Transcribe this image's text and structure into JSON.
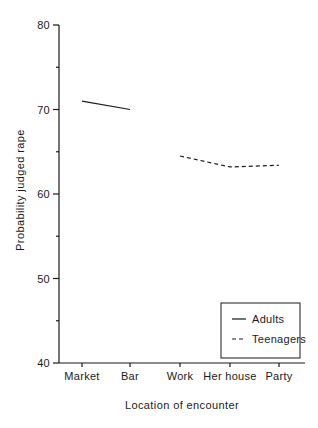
{
  "figure": {
    "background": "#ffffff",
    "ink_color": "#1a1a1a"
  },
  "chart_data": {
    "type": "line",
    "title": "",
    "xlabel": "Location of encounter",
    "ylabel": "Probability judged rape",
    "categories": [
      "Market",
      "Bar",
      "Work",
      "Her house",
      "Party"
    ],
    "series": [
      {
        "name": "Adults",
        "style": "solid",
        "values": [
          71,
          70,
          null,
          null,
          null
        ]
      },
      {
        "name": "Teenagers",
        "style": "dashed",
        "values": [
          null,
          null,
          64.5,
          63.2,
          63.4
        ]
      }
    ],
    "y_axis": {
      "min": 40,
      "max": 80,
      "major_ticks": [
        40,
        50,
        60,
        70,
        80
      ],
      "minor_ticks": [
        45,
        55,
        65,
        75
      ]
    },
    "legend": {
      "position": "bottom-right",
      "entries": [
        "Adults",
        "Teenagers"
      ]
    },
    "grid": false
  }
}
